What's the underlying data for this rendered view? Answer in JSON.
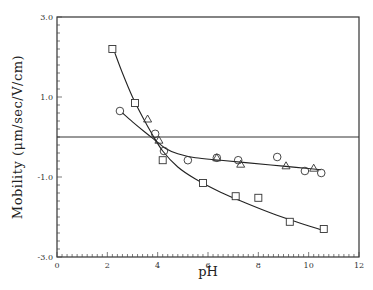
{
  "chart_data": {
    "type": "scatter",
    "title": "",
    "xlabel": "pH",
    "ylabel": "Mobility (μm/sec/V/cm)",
    "xlim": [
      0,
      12
    ],
    "ylim": [
      -3.0,
      3.0
    ],
    "x_ticks": [
      0,
      2,
      4,
      6,
      8,
      10,
      12
    ],
    "x_tick_labels": [
      "0",
      "2",
      "4",
      "6",
      "8",
      "10",
      "12"
    ],
    "x_minor_step": 0.2,
    "y_ticks": [
      -3.0,
      -1.0,
      1.0,
      3.0
    ],
    "y_tick_labels": [
      "-3.0",
      "-1.0",
      "1.0",
      "3.0"
    ],
    "y_minor_step": 0.2,
    "grid": false,
    "legend": null,
    "reference_line": {
      "y": 0,
      "label": ""
    },
    "series": [
      {
        "name": "squares",
        "marker": "square",
        "points": [
          [
            2.2,
            2.2
          ],
          [
            3.1,
            0.85
          ],
          [
            4.2,
            -0.58
          ],
          [
            5.8,
            -1.15
          ],
          [
            7.1,
            -1.48
          ],
          [
            8.0,
            -1.52
          ],
          [
            9.25,
            -2.12
          ],
          [
            10.6,
            -2.3
          ]
        ],
        "fit_curve": [
          [
            2.3,
            2.1
          ],
          [
            2.6,
            1.6
          ],
          [
            3.0,
            1.0
          ],
          [
            3.4,
            0.5
          ],
          [
            3.8,
            0.05
          ],
          [
            4.2,
            -0.35
          ],
          [
            4.8,
            -0.75
          ],
          [
            5.5,
            -1.05
          ],
          [
            6.5,
            -1.38
          ],
          [
            7.5,
            -1.65
          ],
          [
            8.5,
            -1.9
          ],
          [
            9.5,
            -2.12
          ],
          [
            10.5,
            -2.32
          ]
        ]
      },
      {
        "name": "circles",
        "marker": "circle",
        "points": [
          [
            2.5,
            0.65
          ],
          [
            3.9,
            0.08
          ],
          [
            4.25,
            -0.35
          ],
          [
            5.2,
            -0.58
          ],
          [
            6.35,
            -0.52
          ],
          [
            7.2,
            -0.58
          ],
          [
            8.75,
            -0.5
          ],
          [
            9.85,
            -0.85
          ],
          [
            10.5,
            -0.9
          ]
        ],
        "fit_curve": [
          [
            2.6,
            0.6
          ],
          [
            3.0,
            0.38
          ],
          [
            3.5,
            0.12
          ],
          [
            3.9,
            -0.08
          ],
          [
            4.3,
            -0.28
          ],
          [
            4.8,
            -0.42
          ],
          [
            5.5,
            -0.52
          ],
          [
            6.5,
            -0.58
          ],
          [
            7.5,
            -0.64
          ],
          [
            8.5,
            -0.7
          ],
          [
            9.5,
            -0.76
          ],
          [
            10.5,
            -0.82
          ]
        ]
      },
      {
        "name": "triangles",
        "marker": "triangle",
        "points": [
          [
            3.6,
            0.45
          ],
          [
            4.05,
            -0.08
          ],
          [
            6.35,
            -0.52
          ],
          [
            7.3,
            -0.68
          ],
          [
            9.1,
            -0.72
          ],
          [
            10.2,
            -0.78
          ]
        ]
      }
    ]
  }
}
